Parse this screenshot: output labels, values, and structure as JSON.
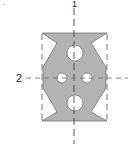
{
  "figure": {
    "corner_mark": "..",
    "axis_labels": {
      "vertical": "1",
      "horizontal": "2"
    },
    "colors": {
      "fill": "#b3b3b3",
      "outline": "#555555",
      "hole": "#ffffff",
      "axis": "#444444",
      "bounding": "#555555"
    },
    "shape": {
      "description": "Symmetric plate with top/bottom bars, V-notched sides, two large holes on vertical axis and two small holes on horizontal axis",
      "holes": [
        {
          "name": "top-large",
          "cx": 75,
          "cy": 53,
          "r": 8
        },
        {
          "name": "bottom-large",
          "cx": 75,
          "cy": 103,
          "r": 8
        },
        {
          "name": "left-small",
          "cx": 62,
          "cy": 78,
          "r": 5
        },
        {
          "name": "right-small",
          "cx": 87,
          "cy": 78,
          "r": 5
        }
      ]
    }
  }
}
